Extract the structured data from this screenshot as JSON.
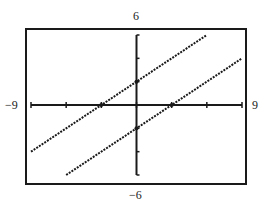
{
  "chart_data": {
    "type": "line",
    "title": "",
    "xlabel": "",
    "ylabel": "",
    "xlim": [
      -9,
      9
    ],
    "ylim": [
      -6,
      6
    ],
    "xscale_ticks": 3,
    "yscale_ticks": 2,
    "grid": false,
    "legend": "none",
    "window_labels": {
      "xmin": "−9",
      "xmax": "9",
      "ymin": "−6",
      "ymax": "6"
    },
    "series": [
      {
        "name": "upper line",
        "equation": "y = (2/3)x + 2",
        "x": [
          -9,
          -3,
          0,
          6
        ],
        "y": [
          -4,
          0,
          2,
          6
        ],
        "style": "dotted"
      },
      {
        "name": "lower line",
        "equation": "y = (2/3)x - 2",
        "x": [
          -6,
          0,
          3,
          9
        ],
        "y": [
          -6,
          -2,
          0,
          4
        ],
        "style": "dotted"
      }
    ],
    "marked_points": [
      {
        "x": 0,
        "y": 2
      },
      {
        "x": -3,
        "y": 0
      },
      {
        "x": 0,
        "y": -2
      },
      {
        "x": 3,
        "y": 0
      }
    ]
  },
  "colors": {
    "ink": "#1a1a1a",
    "background": "#ffffff"
  }
}
